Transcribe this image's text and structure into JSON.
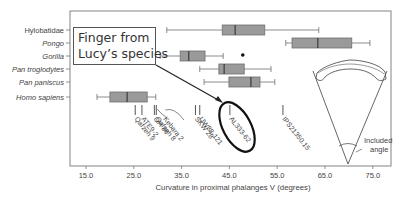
{
  "chart_data": {
    "type": "boxplot",
    "title": "",
    "xlabel": "Curvature in proximal phalanges V (degrees)",
    "ylabel": "",
    "xlim": [
      12,
      79
    ],
    "xticks": [
      15.0,
      25.0,
      35.0,
      45.0,
      55.0,
      65.0,
      75.0
    ],
    "xtick_labels": [
      "15.0",
      "25.0",
      "35.0",
      "45.0",
      "55.0",
      "65.0",
      "75.0"
    ],
    "grid": false,
    "categories": [
      "Hylobatidae",
      "Pongo",
      "Gorilla",
      "Pan troglodytes",
      "Pan paniscus",
      "Homo sapiens"
    ],
    "series": [
      {
        "name": "Hylobatidae",
        "italic": false,
        "whisker_low": 31.9,
        "q1": 43.5,
        "median": 46.2,
        "q3": 52.4,
        "whisker_high": 63.7,
        "outliers": []
      },
      {
        "name": "Pongo",
        "italic": true,
        "whisker_low": 56.8,
        "q1": 58.1,
        "median": 63.5,
        "q3": 70.6,
        "whisker_high": 74.4,
        "outliers": []
      },
      {
        "name": "Gorilla",
        "italic": true,
        "whisker_low": 30.5,
        "q1": 34.7,
        "median": 36.5,
        "q3": 39.9,
        "whisker_high": 43.7,
        "outliers": [
          47.8
        ]
      },
      {
        "name": "Pan troglodytes",
        "italic": true,
        "whisker_low": 38.8,
        "q1": 42.8,
        "median": 43.9,
        "q3": 48.1,
        "whisker_high": 53.7,
        "outliers": []
      },
      {
        "name": "Pan paniscus",
        "italic": true,
        "whisker_low": 39.7,
        "q1": 44.9,
        "median": 49.5,
        "q3": 51.4,
        "whisker_high": 54.5,
        "outliers": []
      },
      {
        "name": "Homo sapiens",
        "italic": true,
        "whisker_low": 17.3,
        "q1": 20.0,
        "median": 23.6,
        "q3": 27.8,
        "whisker_high": 29.6,
        "outliers": []
      }
    ],
    "fossils": [
      {
        "name": "Qafzeh 9",
        "value": 25.3
      },
      {
        "name": "ATE9-2",
        "value": 26.7
      },
      {
        "name": "OH 86",
        "value": 29.3
      },
      {
        "name": "Qafzeh 8",
        "value": 29.7
      },
      {
        "name": "Kebara 2",
        "value": 31.3
      },
      {
        "name": "SKW 28",
        "value": 37.9
      },
      {
        "name": "UW88-121",
        "value": 38.8
      },
      {
        "name": "AL333-62",
        "value": 45.1,
        "highlighted": true
      },
      {
        "name": "IPS21350.15",
        "value": 56.2
      }
    ],
    "annotations": [
      {
        "text": "Finger from Lucy's species",
        "points_to": "AL333-62"
      },
      {
        "text": "Included angle",
        "type": "inset-diagram"
      }
    ]
  },
  "callout": {
    "line1": "Finger from",
    "line2": "Lucy’s species"
  },
  "inset": {
    "label_line1": "Included",
    "label_line2": "angle"
  },
  "colors": {
    "box_fill": "#9a9a9a",
    "box_stroke": "#6e6e6e",
    "axis": "#777777",
    "text": "#444444",
    "highlight_ellipse": "#111111"
  }
}
